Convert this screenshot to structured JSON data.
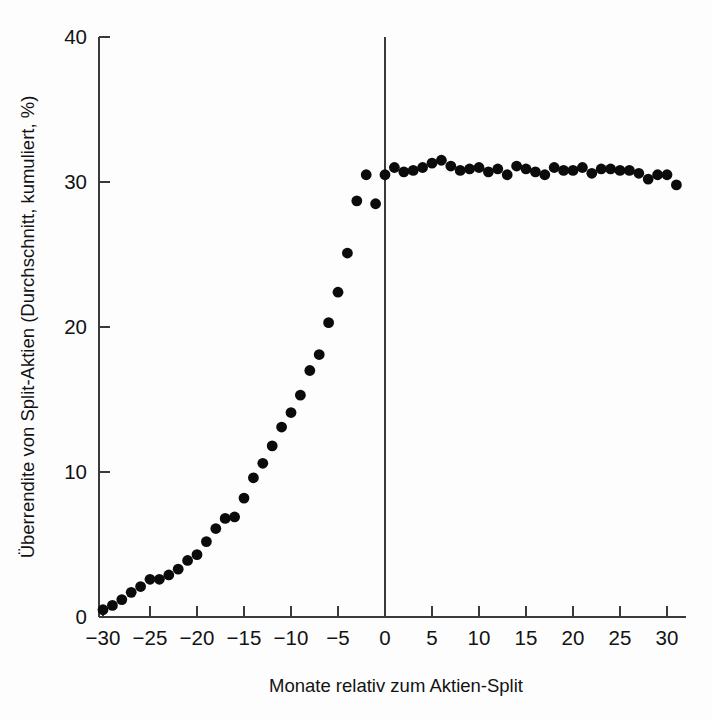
{
  "chart_data": {
    "type": "scatter",
    "title": "",
    "xlabel": "Monate relativ zum Aktien-Split",
    "ylabel": "Überrendite von Split-Aktien (Durchschnitt, kumuliert, %)",
    "xlim": [
      -30,
      31
    ],
    "ylim": [
      0,
      40
    ],
    "grid": false,
    "legend": null,
    "xticks": [
      -30,
      -25,
      -20,
      -15,
      -10,
      -5,
      0,
      5,
      10,
      15,
      20,
      25,
      30
    ],
    "xtick_labels": [
      "−30",
      "−25",
      "−20",
      "−15",
      "−10",
      "−5",
      "0",
      "5",
      "10",
      "15",
      "20",
      "25",
      "30"
    ],
    "yticks": [
      0,
      10,
      20,
      30,
      40
    ],
    "ytick_labels": [
      "0",
      "10",
      "20",
      "30",
      "40"
    ],
    "annotations": [
      {
        "name": "event-line-month-zero",
        "type": "vline",
        "x": 0,
        "label": ""
      }
    ],
    "series": [
      {
        "name": "Überrendite kumuliert",
        "marker": "filled-circle",
        "color": "#0b0b0b",
        "x": [
          -30,
          -29,
          -28,
          -27,
          -26,
          -25,
          -24,
          -23,
          -22,
          -21,
          -20,
          -19,
          -18,
          -17,
          -16,
          -15,
          -14,
          -13,
          -12,
          -11,
          -10,
          -9,
          -8,
          -7,
          -6,
          -5,
          -4,
          -3,
          -2,
          -1,
          0,
          1,
          2,
          3,
          4,
          5,
          6,
          7,
          8,
          9,
          10,
          11,
          12,
          13,
          14,
          15,
          16,
          17,
          18,
          19,
          20,
          21,
          22,
          23,
          24,
          25,
          26,
          27,
          28,
          29,
          30,
          31
        ],
        "y": [
          0.5,
          0.8,
          1.2,
          1.7,
          2.1,
          2.6,
          2.6,
          2.9,
          3.3,
          3.9,
          4.3,
          5.2,
          6.1,
          6.8,
          6.9,
          8.2,
          9.6,
          10.6,
          11.8,
          13.1,
          14.1,
          15.3,
          17.0,
          18.1,
          20.3,
          22.4,
          25.1,
          28.7,
          30.5,
          28.5,
          30.5,
          31.0,
          30.7,
          30.8,
          31.0,
          31.3,
          31.5,
          31.1,
          30.8,
          30.9,
          31.0,
          30.7,
          30.9,
          30.5,
          31.1,
          30.9,
          30.7,
          30.5,
          31.0,
          30.8,
          30.8,
          31.0,
          30.6,
          30.9,
          30.9,
          30.8,
          30.8,
          30.6,
          30.2,
          30.5,
          30.5,
          29.8
        ]
      }
    ]
  },
  "figure": {
    "background": "#fdfdfd",
    "axis_color": "#3a3a3a",
    "marker_color": "#0b0b0b"
  }
}
